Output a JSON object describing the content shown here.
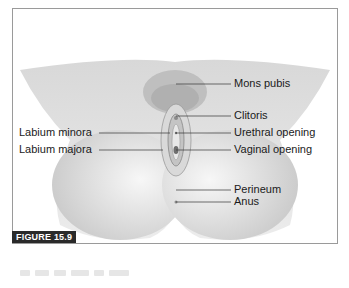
{
  "figure": {
    "tag": "FIGURE 15.9",
    "colors": {
      "border": "#9a9a9a",
      "tag_bg": "#2a2a2a",
      "tag_text": "#ffffff",
      "skin_light": "#f2f2f2",
      "skin_shade": "#cfcfcf",
      "leader": "#333333"
    }
  },
  "labels": {
    "right": [
      {
        "text": "Mons pubis",
        "y": 84
      },
      {
        "text": "Clitoris",
        "y": 116
      },
      {
        "text": "Urethral opening",
        "y": 133
      },
      {
        "text": "Vaginal opening",
        "y": 150
      },
      {
        "text": "Perineum",
        "y": 190
      },
      {
        "text": "Anus",
        "y": 202
      }
    ],
    "left": [
      {
        "text": "Labium minora",
        "y": 133
      },
      {
        "text": "Labium majora",
        "y": 150
      }
    ]
  }
}
